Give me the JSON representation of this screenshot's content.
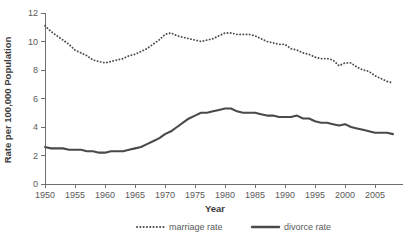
{
  "chart_data": {
    "type": "line",
    "title": "",
    "xlabel": "Year",
    "ylabel": "Rate per 100,000 Population",
    "xlim": [
      1950,
      2008
    ],
    "ylim": [
      0,
      12
    ],
    "grid": false,
    "legend_position": "bottom",
    "xticks": [
      "1950",
      "1955",
      "1960",
      "1965",
      "1970",
      "1975",
      "1980",
      "1985",
      "1990",
      "1995",
      "2000",
      "2005"
    ],
    "xtick_values": [
      1950,
      1955,
      1960,
      1965,
      1970,
      1975,
      1980,
      1985,
      1990,
      1995,
      2000,
      2005
    ],
    "yticks": [
      "0",
      "2",
      "4",
      "6",
      "8",
      "10",
      "12"
    ],
    "ytick_values": [
      0,
      2,
      4,
      6,
      8,
      10,
      12
    ],
    "x": [
      1950,
      1951,
      1952,
      1953,
      1954,
      1955,
      1956,
      1957,
      1958,
      1959,
      1960,
      1961,
      1962,
      1963,
      1964,
      1965,
      1966,
      1967,
      1968,
      1969,
      1970,
      1971,
      1972,
      1973,
      1974,
      1975,
      1976,
      1977,
      1978,
      1979,
      1980,
      1981,
      1982,
      1983,
      1984,
      1985,
      1986,
      1987,
      1988,
      1989,
      1990,
      1991,
      1992,
      1993,
      1994,
      1995,
      1996,
      1997,
      1998,
      1999,
      2000,
      2001,
      2002,
      2003,
      2004,
      2005,
      2006,
      2007,
      2008
    ],
    "series": [
      {
        "name": "marriage rate",
        "style": "dotted",
        "color": "#4a4a4a",
        "values": [
          11.1,
          10.7,
          10.4,
          10.1,
          9.8,
          9.4,
          9.2,
          9.0,
          8.7,
          8.6,
          8.5,
          8.6,
          8.7,
          8.8,
          9.0,
          9.1,
          9.3,
          9.5,
          9.8,
          10.1,
          10.5,
          10.6,
          10.4,
          10.3,
          10.2,
          10.1,
          10.0,
          10.1,
          10.2,
          10.4,
          10.6,
          10.6,
          10.5,
          10.5,
          10.5,
          10.4,
          10.2,
          10.0,
          9.9,
          9.8,
          9.8,
          9.5,
          9.4,
          9.2,
          9.1,
          8.9,
          8.8,
          8.8,
          8.7,
          8.3,
          8.5,
          8.5,
          8.2,
          8.0,
          7.9,
          7.6,
          7.4,
          7.2,
          7.1
        ]
      },
      {
        "name": "divorce rate",
        "style": "solid",
        "color": "#4a4a4a",
        "values": [
          2.6,
          2.5,
          2.5,
          2.5,
          2.4,
          2.4,
          2.4,
          2.3,
          2.3,
          2.2,
          2.2,
          2.3,
          2.3,
          2.3,
          2.4,
          2.5,
          2.6,
          2.8,
          3.0,
          3.2,
          3.5,
          3.7,
          4.0,
          4.3,
          4.6,
          4.8,
          5.0,
          5.0,
          5.1,
          5.2,
          5.3,
          5.3,
          5.1,
          5.0,
          5.0,
          5.0,
          4.9,
          4.8,
          4.8,
          4.7,
          4.7,
          4.7,
          4.8,
          4.6,
          4.6,
          4.4,
          4.3,
          4.3,
          4.2,
          4.1,
          4.2,
          4.0,
          3.9,
          3.8,
          3.7,
          3.6,
          3.6,
          3.6,
          3.5
        ]
      }
    ]
  },
  "legend": {
    "marriage": "marriage rate",
    "divorce": "divorce rate"
  },
  "axes": {
    "x_title": "Year",
    "y_title": "Rate per 100,000 Population"
  }
}
